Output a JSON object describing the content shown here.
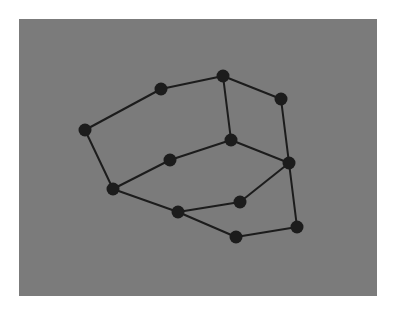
{
  "diagram": {
    "type": "graph",
    "background": "#7b7b7b",
    "node_color": "#1c1c1c",
    "edge_color": "#1c1c1c",
    "node_radius": 6.5,
    "edge_width": 2,
    "nodes": [
      {
        "id": "n1",
        "x": 85,
        "y": 130
      },
      {
        "id": "n2",
        "x": 161,
        "y": 89
      },
      {
        "id": "n3",
        "x": 223,
        "y": 76
      },
      {
        "id": "n4",
        "x": 281,
        "y": 99
      },
      {
        "id": "n5",
        "x": 231,
        "y": 140
      },
      {
        "id": "n6",
        "x": 170,
        "y": 160
      },
      {
        "id": "n7",
        "x": 113,
        "y": 189
      },
      {
        "id": "n8",
        "x": 289,
        "y": 163
      },
      {
        "id": "n9",
        "x": 240,
        "y": 202
      },
      {
        "id": "n10",
        "x": 178,
        "y": 212
      },
      {
        "id": "n11",
        "x": 236,
        "y": 237
      },
      {
        "id": "n12",
        "x": 297,
        "y": 227
      }
    ],
    "edges": [
      [
        "n1",
        "n2"
      ],
      [
        "n2",
        "n3"
      ],
      [
        "n3",
        "n4"
      ],
      [
        "n3",
        "n5"
      ],
      [
        "n4",
        "n8"
      ],
      [
        "n1",
        "n7"
      ],
      [
        "n7",
        "n6"
      ],
      [
        "n6",
        "n5"
      ],
      [
        "n5",
        "n8"
      ],
      [
        "n8",
        "n9"
      ],
      [
        "n9",
        "n10"
      ],
      [
        "n7",
        "n10"
      ],
      [
        "n10",
        "n11"
      ],
      [
        "n11",
        "n12"
      ],
      [
        "n8",
        "n12"
      ]
    ]
  }
}
